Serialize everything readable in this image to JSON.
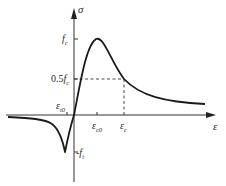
{
  "diagram": {
    "type": "stress-strain curve (concrete, compression positive, tension negative)",
    "axes": {
      "y_label": "σ",
      "x_label": "ε"
    },
    "labels": {
      "fc": {
        "main": "f",
        "sub": "c"
      },
      "half_fc": {
        "prefix": "0.5",
        "main": "f",
        "sub": "c"
      },
      "eps_t0": {
        "main": "ε",
        "sub": "t0"
      },
      "eps_c0": {
        "main": "ε",
        "sub": "c0"
      },
      "eps_c": {
        "main": "ε",
        "sub": "c"
      },
      "ft": {
        "prefix": "-",
        "main": "f",
        "sub": "t"
      }
    },
    "colors": {
      "curve": "#1a1a1a",
      "axis": "#333333",
      "dashed": "#333333",
      "text": "#2b2b2b"
    }
  }
}
